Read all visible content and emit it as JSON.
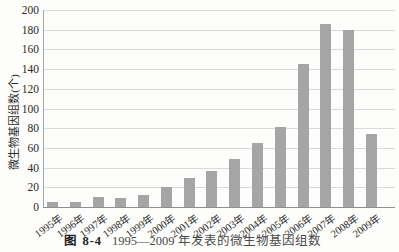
{
  "caption": {
    "label": "图 8-4",
    "text": "1995—2009 年发表的微生物基因组数"
  },
  "chart_data": {
    "type": "bar",
    "title": "",
    "xlabel": "",
    "ylabel": "微生物基因组数(个)",
    "categories": [
      "1995年",
      "1996年",
      "1997年",
      "1998年",
      "1999年",
      "2000年",
      "2001年",
      "2002年",
      "2003年",
      "2004年",
      "2005年",
      "2006年",
      "2007年",
      "2008年",
      "2009年"
    ],
    "values": [
      5,
      5,
      10,
      9,
      12,
      20,
      29,
      37,
      49,
      65,
      81,
      145,
      186,
      180,
      74
    ],
    "ylim": [
      0,
      200
    ],
    "yticks": [
      0,
      20,
      40,
      60,
      80,
      100,
      120,
      140,
      160,
      180,
      200
    ],
    "grid": true,
    "legend": "none",
    "bar_color": "#a5a5a5",
    "gridline_color": "#dadada",
    "axis_color": "#8f8f8f",
    "text_color": "#2a2a2a"
  }
}
